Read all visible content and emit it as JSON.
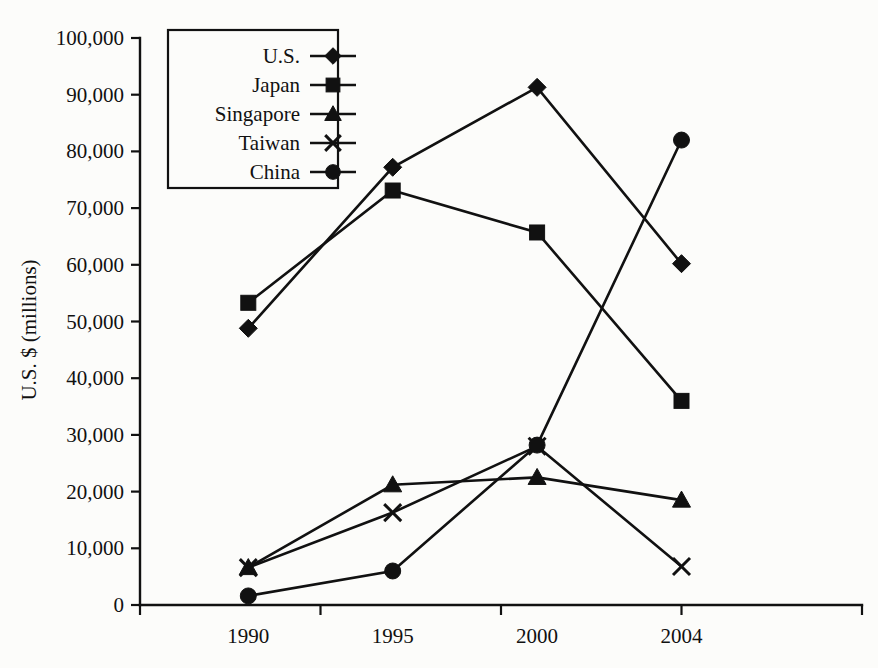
{
  "chart_data": {
    "type": "line",
    "title": "",
    "subtitle": "",
    "xlabel": "",
    "ylabel": "U.S. $ (millions)",
    "categories": [
      "1990",
      "1995",
      "2000",
      "2004"
    ],
    "x": [
      1990,
      1995,
      2000,
      2004
    ],
    "ylim": [
      0,
      100000
    ],
    "ytick_values": [
      0,
      10000,
      20000,
      30000,
      40000,
      50000,
      60000,
      70000,
      80000,
      90000,
      100000
    ],
    "ytick_labels": [
      "0",
      "10,000",
      "20,000",
      "30,000",
      "40,000",
      "50,000",
      "60,000",
      "70,000",
      "80,000",
      "90,000",
      "100,000"
    ],
    "grid": false,
    "legend_position": "top-left-inside",
    "series": [
      {
        "name": "U.S.",
        "marker": "diamond",
        "values": [
          48800,
          77200,
          91300,
          60200
        ]
      },
      {
        "name": "Japan",
        "marker": "square",
        "values": [
          53300,
          73100,
          65700,
          36000
        ]
      },
      {
        "name": "Singapore",
        "marker": "triangle",
        "values": [
          6600,
          21200,
          22500,
          18500
        ]
      },
      {
        "name": "Taiwan",
        "marker": "x",
        "values": [
          6600,
          16300,
          28000,
          6800
        ]
      },
      {
        "name": "China",
        "marker": "circle",
        "values": [
          1600,
          6000,
          28200,
          82000
        ]
      }
    ]
  },
  "legend": {
    "entries": [
      {
        "label": "U.S.",
        "marker": "diamond"
      },
      {
        "label": "Japan",
        "marker": "square"
      },
      {
        "label": "Singapore",
        "marker": "triangle"
      },
      {
        "label": "Taiwan",
        "marker": "x"
      },
      {
        "label": "China",
        "marker": "circle"
      }
    ]
  },
  "axes": {
    "y_title": "U.S. $ (millions)",
    "x_tick_labels": [
      "1990",
      "1995",
      "2000",
      "2004"
    ],
    "y_tick_labels": [
      "100,000",
      "90,000",
      "80,000",
      "70,000",
      "60,000",
      "50,000",
      "40,000",
      "30,000",
      "20,000",
      "10,000",
      "0"
    ]
  }
}
